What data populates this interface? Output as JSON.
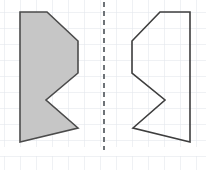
{
  "worksheet": {
    "title": "Reflection over vertical dashed line of symmetry",
    "canvas": {
      "width": 206,
      "height": 170,
      "background": "#ffffff"
    }
  },
  "grid": {
    "name": "graph-paper-grid",
    "cell_size": 16,
    "line_color": "#dfe4ea",
    "line_width": 1,
    "origin_x": 4,
    "origin_y": 12,
    "margin_band": {
      "top": 148,
      "bottom": 155,
      "color": "#ffffff"
    }
  },
  "mirror_line": {
    "name": "line-of-symmetry",
    "x": 104,
    "y_top": 2,
    "y_bottom": 150,
    "color": "#6e7378",
    "width": 2,
    "dash": "5 4"
  },
  "shapes": [
    {
      "id": "left-shape",
      "label": "filled-polygon",
      "fill": "#c6c6c6",
      "stroke": "#4b4b4b",
      "stroke_width": 1.6,
      "points": [
        [
          20,
          12
        ],
        [
          47,
          12
        ],
        [
          78,
          41
        ],
        [
          78,
          73
        ],
        [
          46,
          100
        ],
        [
          78,
          128
        ],
        [
          20,
          142
        ]
      ]
    },
    {
      "id": "right-shape",
      "label": "outline-polygon",
      "fill": "none",
      "stroke": "#3e3e3e",
      "stroke_width": 1.6,
      "points": [
        [
          190,
          12
        ],
        [
          160,
          12
        ],
        [
          132,
          41
        ],
        [
          132,
          73
        ],
        [
          165,
          100
        ],
        [
          133,
          128
        ],
        [
          190,
          142
        ]
      ]
    }
  ],
  "chart_data": {
    "type": "scatter",
    "xlabel": "",
    "ylabel": "",
    "series": [
      {
        "name": "left-shape",
        "values": [
          [
            20,
            12
          ],
          [
            47,
            12
          ],
          [
            78,
            41
          ],
          [
            78,
            73
          ],
          [
            46,
            100
          ],
          [
            78,
            128
          ],
          [
            20,
            142
          ]
        ]
      },
      {
        "name": "right-shape",
        "values": [
          [
            190,
            12
          ],
          [
            160,
            12
          ],
          [
            132,
            41
          ],
          [
            132,
            73
          ],
          [
            165,
            100
          ],
          [
            133,
            128
          ],
          [
            190,
            142
          ]
        ]
      }
    ]
  }
}
